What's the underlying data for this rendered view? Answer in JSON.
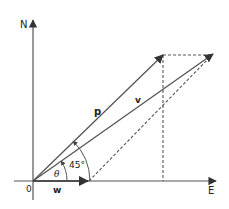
{
  "diagram": {
    "axes": {
      "north_label": "N",
      "east_label": "E",
      "origin_label": "0"
    },
    "vectors": [
      {
        "name": "p",
        "label": "p",
        "bold": true
      },
      {
        "name": "v",
        "label": "v",
        "bold": true
      },
      {
        "name": "w",
        "label": "w",
        "bold": true
      }
    ],
    "angles": {
      "theta_label": "θ",
      "angle_45_label": "45°"
    },
    "colors": {
      "line": "#555555",
      "text": "#222222",
      "background": "#ffffff"
    }
  }
}
